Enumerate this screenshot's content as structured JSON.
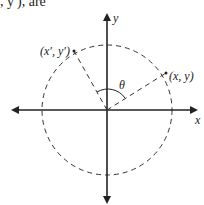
{
  "header": {
    "text": ", y′), are"
  },
  "diagram": {
    "axis_x_label": "x",
    "axis_y_label": "y",
    "point_rotated_label": "(x′, y′)",
    "point_original_label": "(x, y)",
    "angle_label": "θ",
    "colors": {
      "stroke": "#222222",
      "background": "#ffffff"
    }
  }
}
